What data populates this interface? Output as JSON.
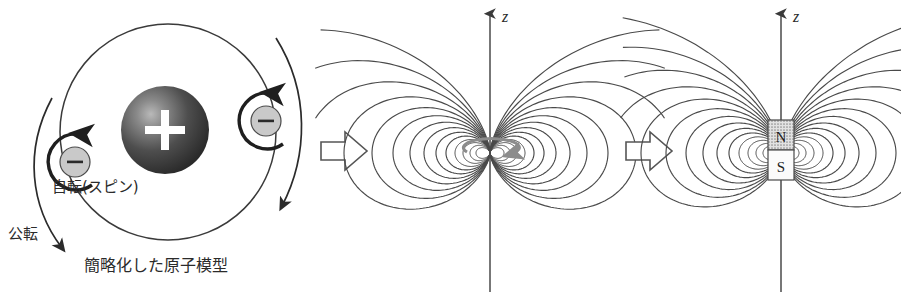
{
  "figure": {
    "background": "#ffffff",
    "ink": "#2b2b2b",
    "width": 901,
    "height": 300
  },
  "panels": [
    {
      "id": "atom",
      "name": "simplified-atomic-model",
      "caption": "簡略化した原子模型",
      "labels": {
        "spin": "自転(スピン)",
        "orbit": "公転"
      },
      "nucleus": {
        "symbol": "+",
        "fill_dark": "#3a3a3a",
        "fill_light": "#9a9a9a",
        "radius": 44,
        "cx": 165,
        "cy": 130
      },
      "electrons": [
        {
          "symbol": "−",
          "cx": 75,
          "cy": 162,
          "r": 15,
          "fill": "#c8c8c8",
          "spin_direction": "counterclockwise"
        },
        {
          "symbol": "−",
          "cx": 266,
          "cy": 121,
          "r": 15,
          "fill": "#c8c8c8",
          "spin_direction": "counterclockwise"
        }
      ],
      "orbit": {
        "cx": 168,
        "cy": 132,
        "rx": 108,
        "ry": 108
      },
      "revolution_arcs": 2
    },
    {
      "id": "loop",
      "name": "magnetic-dipole-field-of-current-loop",
      "axis_label": "z",
      "axis": {
        "x": 135,
        "y_top": 12,
        "y_bottom": 292
      },
      "source": {
        "type": "current-loop",
        "color": "#8c8c8c",
        "cx": 135,
        "cy": 150,
        "rx": 28,
        "ry": 9
      },
      "field_line_count": 12
    },
    {
      "id": "magnet",
      "name": "magnetic-dipole-field-of-bar-magnet",
      "axis_label": "z",
      "axis": {
        "x": 121,
        "y_top": 12,
        "y_bottom": 292
      },
      "source": {
        "type": "bar-magnet",
        "north_label": "N",
        "south_label": "S",
        "north_fill": "#b4b4b4",
        "south_fill": "#fbfbfb",
        "x": 108,
        "y": 120,
        "w": 26,
        "h": 60
      },
      "field_line_count": 12
    }
  ],
  "separators": [
    {
      "name": "arrow-atom-to-loop",
      "glyph": "block-arrow-right"
    },
    {
      "name": "arrow-loop-to-magnet",
      "glyph": "block-arrow-right"
    }
  ],
  "chart_data": {
    "type": "line",
    "xlabel": "",
    "ylabel": "z",
    "legend": [],
    "grid": false,
    "series": [
      {
        "name": "dipole-field-lines-loop",
        "values": [
          1,
          2,
          3,
          4,
          5,
          6,
          7,
          8,
          9,
          10,
          11,
          12
        ]
      },
      {
        "name": "dipole-field-lines-magnet",
        "values": [
          1,
          2,
          3,
          4,
          5,
          6,
          7,
          8,
          9,
          10,
          11,
          12
        ]
      }
    ]
  }
}
